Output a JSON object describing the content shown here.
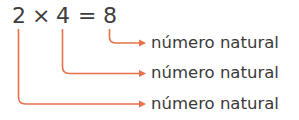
{
  "equation": {
    "factor1": "2",
    "operator": "×",
    "factor2": "4",
    "equals": "=",
    "product": "8"
  },
  "labels": [
    {
      "text": "número natural",
      "points_to": "8"
    },
    {
      "text": "número natural",
      "points_to": "4"
    },
    {
      "text": "número natural",
      "points_to": "2"
    }
  ],
  "colors": {
    "arrow": "#E8704A",
    "text": "#3a3a3a"
  }
}
